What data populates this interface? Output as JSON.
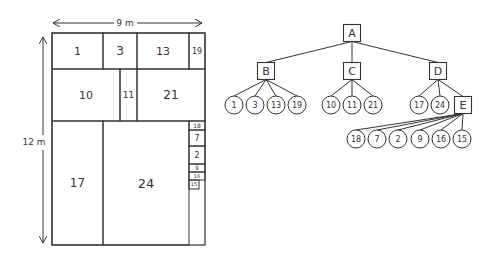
{
  "treemap": {
    "width_label": "9 m",
    "height_label": "12 m",
    "cells": [
      {
        "id": "1",
        "x": 52,
        "y": 33,
        "w": 51,
        "h": 36,
        "fs": 11
      },
      {
        "id": "3",
        "x": 103,
        "y": 33,
        "w": 34,
        "h": 36,
        "fs": 12
      },
      {
        "id": "13",
        "x": 137,
        "y": 33,
        "w": 52,
        "h": 36,
        "fs": 11
      },
      {
        "id": "19",
        "x": 189,
        "y": 33,
        "w": 16,
        "h": 36,
        "fs": 8
      },
      {
        "id": "10",
        "x": 52,
        "y": 69,
        "w": 68,
        "h": 52,
        "fs": 11
      },
      {
        "id": "11",
        "x": 120,
        "y": 69,
        "w": 17,
        "h": 52,
        "fs": 9
      },
      {
        "id": "21",
        "x": 137,
        "y": 69,
        "w": 68,
        "h": 52,
        "fs": 12
      },
      {
        "id": "17",
        "x": 52,
        "y": 121,
        "w": 51,
        "h": 124,
        "fs": 12
      },
      {
        "id": "24",
        "x": 103,
        "y": 121,
        "w": 86,
        "h": 124,
        "fs": 13
      },
      {
        "id": "18",
        "x": 189,
        "y": 121,
        "w": 16,
        "h": 9,
        "fs": 6
      },
      {
        "id": "7",
        "x": 189,
        "y": 130,
        "w": 16,
        "h": 16,
        "fs": 8
      },
      {
        "id": "2",
        "x": 189,
        "y": 146,
        "w": 16,
        "h": 18,
        "fs": 8
      },
      {
        "id": "9",
        "x": 189,
        "y": 164,
        "w": 16,
        "h": 8,
        "fs": 6
      },
      {
        "id": "16",
        "x": 189,
        "y": 172,
        "w": 16,
        "h": 8,
        "fs": 5
      },
      {
        "id": "15",
        "x": 189,
        "y": 180,
        "w": 10,
        "h": 9,
        "fs": 5
      }
    ]
  },
  "tree": {
    "root": {
      "label": "A",
      "x": 352,
      "y": 33
    },
    "internal": [
      {
        "label": "B",
        "x": 266,
        "y": 71
      },
      {
        "label": "C",
        "x": 352,
        "y": 71
      },
      {
        "label": "D",
        "x": 438,
        "y": 71
      },
      {
        "label": "E",
        "x": 463,
        "y": 105
      }
    ],
    "edges_internal": [
      [
        "A",
        "B"
      ],
      [
        "A",
        "C"
      ],
      [
        "A",
        "D"
      ],
      [
        "D",
        "E"
      ]
    ],
    "leaves": [
      {
        "label": "1",
        "parent": "B",
        "x": 234,
        "y": 105
      },
      {
        "label": "3",
        "parent": "B",
        "x": 255,
        "y": 105
      },
      {
        "label": "13",
        "parent": "B",
        "x": 276,
        "y": 105
      },
      {
        "label": "19",
        "parent": "B",
        "x": 297,
        "y": 105
      },
      {
        "label": "10",
        "parent": "C",
        "x": 331,
        "y": 105
      },
      {
        "label": "11",
        "parent": "C",
        "x": 352,
        "y": 105
      },
      {
        "label": "21",
        "parent": "C",
        "x": 373,
        "y": 105
      },
      {
        "label": "17",
        "parent": "D",
        "x": 419,
        "y": 105
      },
      {
        "label": "24",
        "parent": "D",
        "x": 440,
        "y": 105
      },
      {
        "label": "18",
        "parent": "E",
        "x": 356,
        "y": 139
      },
      {
        "label": "7",
        "parent": "E",
        "x": 377,
        "y": 139
      },
      {
        "label": "2",
        "parent": "E",
        "x": 398,
        "y": 139
      },
      {
        "label": "9",
        "parent": "E",
        "x": 420,
        "y": 139
      },
      {
        "label": "16",
        "parent": "E",
        "x": 441,
        "y": 139
      },
      {
        "label": "15",
        "parent": "E",
        "x": 462,
        "y": 139
      }
    ]
  }
}
